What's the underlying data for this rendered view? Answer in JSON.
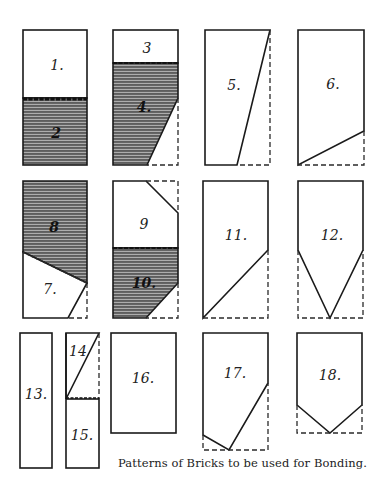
{
  "caption": "Patterns of Bricks to be used for Bonding.",
  "colors": {
    "line": "#1a1a1a",
    "hatch_bg": "#8a8a8a",
    "hatch_line": "#3a3a3a",
    "paper": "#ffffff"
  },
  "pieces": [
    {
      "id": 1,
      "label": "1.",
      "shading": "plain",
      "brick": "A",
      "part": "upper half"
    },
    {
      "id": 2,
      "label": "2",
      "shading": "hatched",
      "brick": "A",
      "part": "lower half"
    },
    {
      "id": 3,
      "label": "3",
      "shading": "plain",
      "brick": "B",
      "part": "upper quarter"
    },
    {
      "id": 4,
      "label": "4.",
      "shading": "hatched",
      "brick": "B",
      "part": "lower part with cut corner"
    },
    {
      "id": 5,
      "label": "5.",
      "shading": "plain",
      "brick": "C",
      "part": "tapered diagonal cut"
    },
    {
      "id": 6,
      "label": "6.",
      "shading": "plain",
      "brick": "D",
      "part": "shallow diagonal cut at base"
    },
    {
      "id": 7,
      "label": "7.",
      "shading": "plain",
      "brick": "E",
      "part": "lower piece with clipped corner"
    },
    {
      "id": 8,
      "label": "8",
      "shading": "hatched",
      "brick": "E",
      "part": "upper piece with sloped base"
    },
    {
      "id": 9,
      "label": "9",
      "shading": "plain",
      "brick": "F",
      "part": "upper half with clipped corner"
    },
    {
      "id": 10,
      "label": "10.",
      "shading": "hatched",
      "brick": "F",
      "part": "lower half with clipped corner"
    },
    {
      "id": 11,
      "label": "11.",
      "shading": "plain",
      "brick": "G",
      "part": "diagonal cut at base"
    },
    {
      "id": 12,
      "label": "12.",
      "shading": "plain",
      "brick": "H",
      "part": "pointed base"
    },
    {
      "id": 13,
      "label": "13.",
      "shading": "plain",
      "brick": "I",
      "part": "half-width strip"
    },
    {
      "id": 14,
      "label": "14",
      "shading": "plain",
      "brick": "J",
      "part": "triangular upper piece"
    },
    {
      "id": 15,
      "label": "15.",
      "shading": "plain",
      "brick": "J",
      "part": "lower rectangular piece"
    },
    {
      "id": 16,
      "label": "16.",
      "shading": "plain",
      "brick": "K",
      "part": "three-quarter length"
    },
    {
      "id": 17,
      "label": "17.",
      "shading": "plain",
      "brick": "L",
      "part": "asymmetric pointed base"
    },
    {
      "id": 18,
      "label": "18.",
      "shading": "plain",
      "brick": "M",
      "part": "short pointed base"
    }
  ],
  "labels": {
    "p1": "1.",
    "p2": "2",
    "p3": "3",
    "p4": "4.",
    "p5": "5.",
    "p6": "6.",
    "p7": "7.",
    "p8": "8",
    "p9": "9",
    "p10": "10.",
    "p11": "11.",
    "p12": "12.",
    "p13": "13.",
    "p14": "14",
    "p15": "15.",
    "p16": "16.",
    "p17": "17.",
    "p18": "18."
  }
}
